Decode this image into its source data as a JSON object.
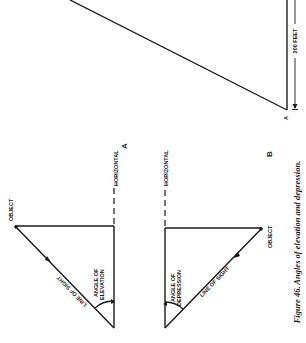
{
  "figure": {
    "caption": "Figure 46. Angles of elevation and depression.",
    "orientation": "rotated 90° counter-clockwise"
  },
  "top_diagram": {
    "point_label": "A",
    "dimension_label": "200 FEET"
  },
  "diagram_a": {
    "panel_letter": "A",
    "object_label": "OBJECT",
    "horizontal_label": "HORIZONTAL",
    "line_of_sight_label": "LINE OF SIGHT",
    "angle_label_line1": "ANGLE OF",
    "angle_label_line2": "ELEVATION"
  },
  "diagram_b": {
    "panel_letter": "B",
    "object_label": "OBJECT",
    "horizontal_label": "HORIZONTAL",
    "line_of_sight_label": "LINE OF SIGHT",
    "angle_label_line1": "ANGLE OF",
    "angle_label_line2": "DEPRESSION"
  },
  "colors": {
    "ink": "#1a1a1a",
    "paper": "#ffffff"
  }
}
